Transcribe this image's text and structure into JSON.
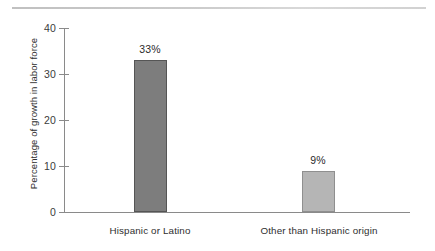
{
  "chart_data": {
    "type": "bar",
    "title": "",
    "xlabel": "",
    "ylabel": "Percentage of growth in labor force",
    "categories": [
      "Hispanic or Latino",
      "Other than Hispanic origin"
    ],
    "values": [
      33,
      9
    ],
    "value_labels": [
      "33%",
      "9%"
    ],
    "ylim": [
      0,
      40
    ],
    "yticks": [
      0,
      10,
      20,
      30,
      40
    ],
    "ytick_labels": [
      "0",
      "10",
      "20",
      "30",
      "40"
    ],
    "grid": false,
    "legend": null,
    "bar_colors": [
      "#7d7d7d",
      "#b5b5b5"
    ],
    "bar_edge_colors": [
      "#555555",
      "#8f8f8f"
    ],
    "axis_color": "#8a8a8a",
    "text_color": "#2e2e2e"
  }
}
